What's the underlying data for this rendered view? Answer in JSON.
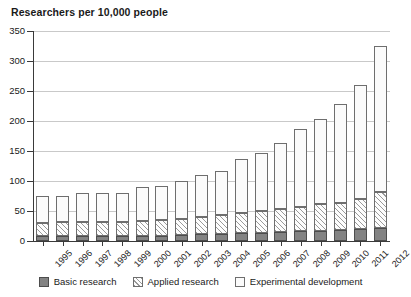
{
  "chart_data": {
    "type": "bar",
    "title": "Researchers per 10,000 people",
    "xlabel": "",
    "ylabel": "",
    "ylim": [
      0,
      350
    ],
    "yticks": [
      0,
      50,
      100,
      150,
      200,
      250,
      300,
      350
    ],
    "ytick_labels": [
      "0",
      "50",
      "100",
      "150",
      "200",
      "250",
      "300",
      "350"
    ],
    "grid": true,
    "stacked": true,
    "legend_position": "bottom",
    "categories": [
      "1995",
      "1996",
      "1997",
      "1998",
      "1999",
      "2000",
      "2001",
      "2002",
      "2003",
      "2004",
      "2005",
      "2006",
      "2007",
      "2008",
      "2009",
      "2010",
      "2011",
      "2012"
    ],
    "series": [
      {
        "name": "Basic research",
        "fill": "solid-gray",
        "color": "#838383",
        "values": [
          8,
          8,
          8,
          8,
          8,
          9,
          9,
          10,
          11,
          12,
          13,
          14,
          15,
          16,
          17,
          18,
          20,
          22
        ]
      },
      {
        "name": "Applied research",
        "fill": "diagonal-hatch",
        "color": "#9a9a9a",
        "values": [
          22,
          23,
          24,
          24,
          24,
          25,
          26,
          27,
          29,
          31,
          33,
          36,
          38,
          41,
          44,
          46,
          50,
          60
        ]
      },
      {
        "name": "Experimental development",
        "fill": "dotted",
        "color": "#b2b2b2",
        "values": [
          45,
          44,
          48,
          48,
          48,
          56,
          57,
          63,
          70,
          74,
          90,
          97,
          110,
          129,
          143,
          165,
          190,
          243
        ]
      }
    ],
    "totals": [
      75,
      75,
      80,
      80,
      80,
      90,
      92,
      100,
      110,
      117,
      136,
      147,
      163,
      186,
      204,
      229,
      260,
      325
    ]
  },
  "legend": {
    "items": [
      {
        "label": "Basic research",
        "swatch": "solid-gray-swatch"
      },
      {
        "label": "Applied research",
        "swatch": "diagonal-hatch-swatch"
      },
      {
        "label": "Experimental development",
        "swatch": "dotted-swatch"
      }
    ]
  }
}
